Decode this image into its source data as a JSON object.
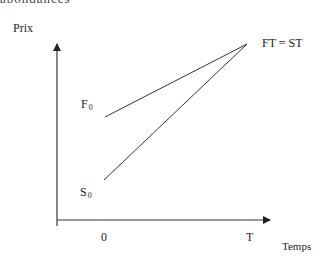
{
  "page": {
    "cutoff_text": "abondances"
  },
  "diagram": {
    "title": "",
    "y_axis": {
      "label": "Prix"
    },
    "x_axis": {
      "label": "Temps",
      "ticks": [
        "0",
        "T"
      ]
    },
    "points": {
      "F0": {
        "letter": "F",
        "sub": "0"
      },
      "S0": {
        "letter": "S",
        "sub": "0"
      },
      "convergence": "FT = ST"
    },
    "lines": [
      {
        "name": "futures-price-line",
        "from": "F0",
        "to": "FT = ST"
      },
      {
        "name": "spot-price-line",
        "from": "S0",
        "to": "FT = ST"
      }
    ],
    "colors": {
      "stroke": "#333333",
      "text": "#222222"
    }
  }
}
